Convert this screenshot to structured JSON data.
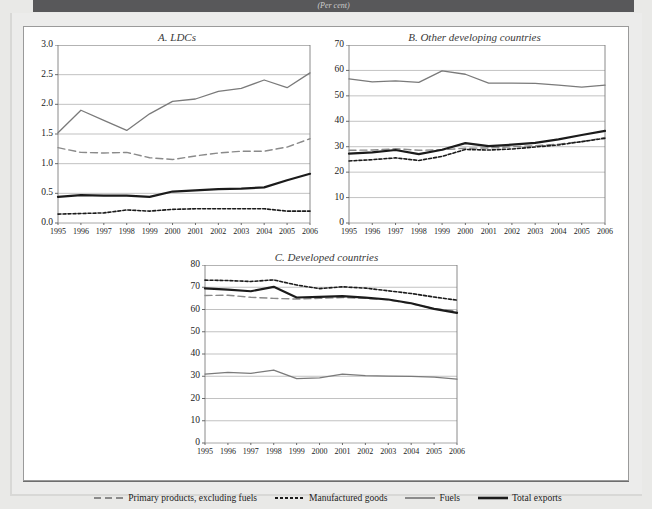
{
  "figure": {
    "top_band_text": "(Per cent)",
    "background_color": "#e9e9e7",
    "card_color": "#ffffff"
  },
  "legend": {
    "items": [
      {
        "label": "Primary products, excluding fuels",
        "style": "long-dash",
        "color": "#8a8a8a",
        "icon": "dashed-line-icon"
      },
      {
        "label": "Manufactured goods",
        "style": "short-dash",
        "color": "#1b1b1b",
        "icon": "dotted-line-icon"
      },
      {
        "label": "Fuels",
        "style": "solid-thin",
        "color": "#7a7a7a",
        "icon": "solid-line-icon"
      },
      {
        "label": "Total exports",
        "style": "solid-thick",
        "color": "#1b1b1b",
        "icon": "thick-line-icon"
      }
    ]
  },
  "chart_data": [
    {
      "type": "line",
      "panel": "A",
      "title": "A. LDCs",
      "xlabel": "",
      "ylabel": "",
      "x": [
        "1995",
        "1996",
        "1997",
        "1998",
        "1999",
        "2000",
        "2001",
        "2002",
        "2003",
        "2004",
        "2005",
        "2006"
      ],
      "ylim": [
        0.0,
        3.0
      ],
      "yticks": [
        "0.0",
        "0.5",
        "1.0",
        "1.5",
        "2.0",
        "2.5",
        "3.0"
      ],
      "grid": true,
      "legend_position": "bottom-shared",
      "series": [
        {
          "name": "Primary products, excluding fuels",
          "style": "long-dash",
          "color": "#8a8a8a",
          "values": [
            1.27,
            1.19,
            1.18,
            1.19,
            1.1,
            1.07,
            1.13,
            1.18,
            1.21,
            1.21,
            1.28,
            1.42
          ]
        },
        {
          "name": "Manufactured goods",
          "style": "short-dash",
          "color": "#1b1b1b",
          "values": [
            0.15,
            0.16,
            0.17,
            0.22,
            0.2,
            0.23,
            0.24,
            0.24,
            0.24,
            0.24,
            0.2,
            0.2
          ]
        },
        {
          "name": "Fuels",
          "style": "solid-thin",
          "color": "#7a7a7a",
          "values": [
            1.52,
            1.9,
            1.73,
            1.56,
            1.84,
            2.05,
            2.09,
            2.22,
            2.27,
            2.41,
            2.28,
            2.53
          ]
        },
        {
          "name": "Total exports",
          "style": "solid-thick",
          "color": "#1b1b1b",
          "values": [
            0.44,
            0.47,
            0.46,
            0.46,
            0.44,
            0.53,
            0.55,
            0.57,
            0.58,
            0.6,
            0.72,
            0.83
          ]
        }
      ]
    },
    {
      "type": "line",
      "panel": "B",
      "title": "B. Other developing countries",
      "xlabel": "",
      "ylabel": "",
      "x": [
        "1995",
        "1996",
        "1997",
        "1998",
        "1999",
        "2000",
        "2001",
        "2002",
        "2003",
        "2004",
        "2005",
        "2006"
      ],
      "ylim": [
        0,
        70
      ],
      "yticks": [
        "0",
        "10",
        "20",
        "30",
        "40",
        "50",
        "60",
        "70"
      ],
      "grid": true,
      "legend_position": "bottom-shared",
      "series": [
        {
          "name": "Primary products, excluding fuels",
          "style": "long-dash",
          "color": "#8a8a8a",
          "values": [
            28.6,
            28.7,
            29.2,
            28.6,
            28.8,
            29.4,
            29.5,
            30.0,
            30.4,
            31.0,
            32.0,
            33.6
          ]
        },
        {
          "name": "Manufactured goods",
          "style": "short-dash",
          "color": "#1b1b1b",
          "values": [
            24.4,
            24.9,
            25.6,
            24.6,
            26.2,
            28.9,
            28.7,
            29.1,
            29.9,
            30.7,
            32.0,
            33.3
          ]
        },
        {
          "name": "Fuels",
          "style": "solid-thin",
          "color": "#7a7a7a",
          "values": [
            56.7,
            55.5,
            55.9,
            55.3,
            59.8,
            58.5,
            55.0,
            55.0,
            54.9,
            54.2,
            53.4,
            54.2
          ]
        },
        {
          "name": "Total exports",
          "style": "solid-thick",
          "color": "#1b1b1b",
          "values": [
            27.3,
            27.8,
            28.7,
            27.1,
            28.8,
            31.4,
            30.2,
            30.8,
            31.5,
            32.9,
            34.6,
            36.2
          ]
        }
      ]
    },
    {
      "type": "line",
      "panel": "C",
      "title": "C. Developed countries",
      "xlabel": "",
      "ylabel": "",
      "x": [
        "1995",
        "1996",
        "1997",
        "1998",
        "1999",
        "2000",
        "2001",
        "2002",
        "2003",
        "2004",
        "2005",
        "2006"
      ],
      "ylim": [
        0,
        80
      ],
      "yticks": [
        "0",
        "10",
        "20",
        "30",
        "40",
        "50",
        "60",
        "70",
        "80"
      ],
      "grid": true,
      "legend_position": "bottom-shared",
      "series": [
        {
          "name": "Primary products, excluding fuels",
          "style": "long-dash",
          "color": "#8a8a8a",
          "values": [
            66.3,
            66.4,
            65.5,
            65.0,
            64.7,
            65.0,
            65.4,
            65.0,
            64.3,
            62.6,
            60.4,
            59.3
          ]
        },
        {
          "name": "Manufactured goods",
          "style": "short-dash",
          "color": "#1b1b1b",
          "values": [
            73.2,
            73.0,
            72.6,
            73.3,
            71.0,
            69.4,
            70.2,
            69.6,
            68.4,
            67.2,
            65.6,
            64.2
          ]
        },
        {
          "name": "Fuels",
          "style": "solid-thin",
          "color": "#7a7a7a",
          "values": [
            31.0,
            31.7,
            31.3,
            32.8,
            28.9,
            29.3,
            31.0,
            30.3,
            30.1,
            29.9,
            29.6,
            28.7
          ]
        },
        {
          "name": "Total exports",
          "style": "solid-thick",
          "color": "#1b1b1b",
          "values": [
            69.5,
            68.9,
            68.2,
            70.2,
            65.4,
            65.7,
            66.0,
            65.3,
            64.5,
            62.8,
            60.3,
            58.5
          ]
        }
      ]
    }
  ]
}
